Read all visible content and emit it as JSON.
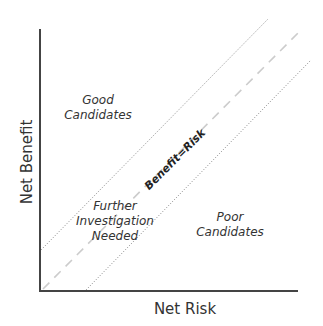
{
  "diagram": {
    "type": "quadrant-risk-benefit",
    "axes": {
      "x_label": "Net Risk",
      "y_label": "Net Benefit"
    },
    "lines": {
      "center_label": "Benefit=Risk",
      "center_style": "dashed",
      "band_style": "dotted"
    },
    "regions": {
      "good": {
        "line1": "Good",
        "line2": "Candidates"
      },
      "further": {
        "line1": "Further",
        "line2": "Investigation",
        "line3": "Needed"
      },
      "poor": {
        "line1": "Poor",
        "line2": "Candidates"
      }
    },
    "colors": {
      "axis": "#444444",
      "text": "#333333",
      "dotted_line": "#9a9a9a",
      "dashed_line": "#cccccc",
      "background": "#ffffff"
    }
  }
}
